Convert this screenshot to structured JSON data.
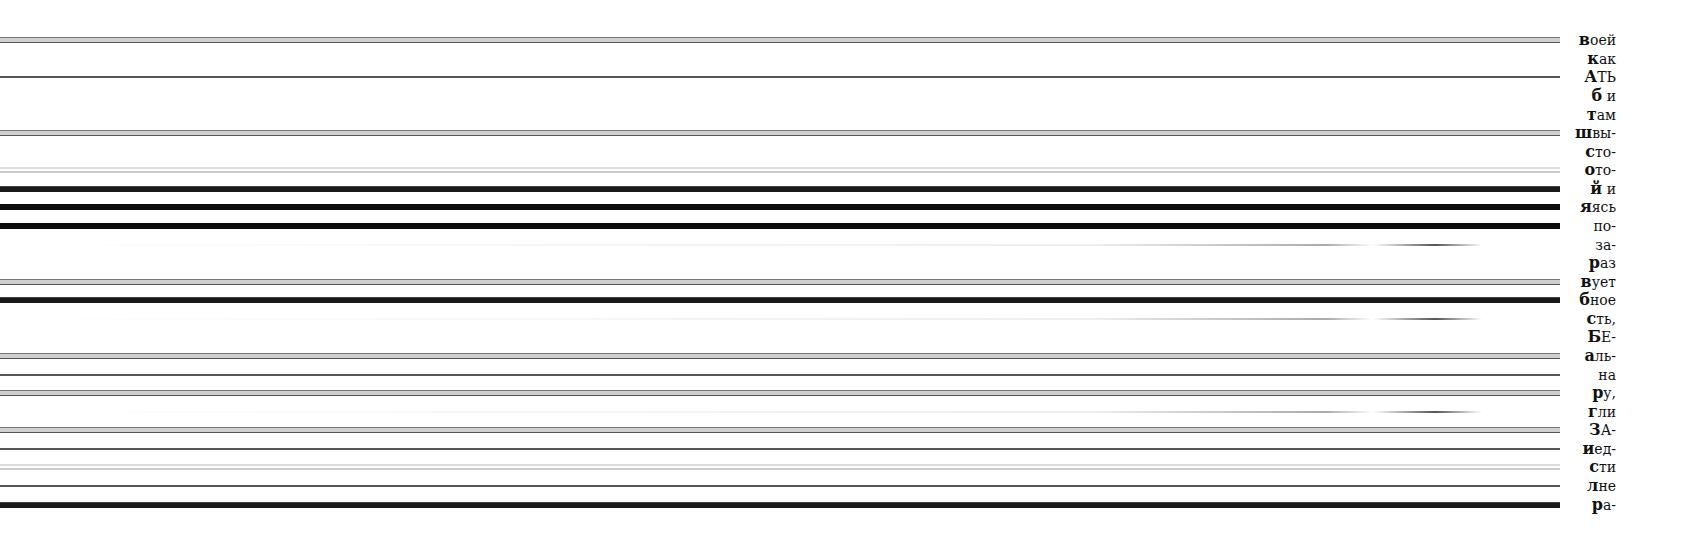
{
  "document": {
    "language": "ru",
    "lines": [
      {
        "y": 39,
        "style": "double",
        "lead": "в",
        "text": "оей"
      },
      {
        "y": 58,
        "style": "none",
        "lead": "к",
        "text": "ак"
      },
      {
        "y": 76,
        "style": "thin",
        "lead": "А",
        "text": "ТЬ"
      },
      {
        "y": 95,
        "style": "none",
        "lead": "б",
        "text": " и"
      },
      {
        "y": 114,
        "style": "none",
        "lead": "т",
        "text": "ам"
      },
      {
        "y": 132,
        "style": "double",
        "lead": "ш",
        "text": "вы-"
      },
      {
        "y": 151,
        "style": "none",
        "lead": "с",
        "text": "то-"
      },
      {
        "y": 169,
        "style": "faint",
        "lead": "о",
        "text": "то-"
      },
      {
        "y": 188,
        "style": "heavy",
        "lead": "й",
        "text": "  и"
      },
      {
        "y": 206,
        "style": "xheavy",
        "lead": "я",
        "text": "ясь"
      },
      {
        "y": 225,
        "style": "xheavy",
        "lead": "",
        "text": "по-"
      },
      {
        "y": 244,
        "style": "dash",
        "lead": "",
        "text": "за-"
      },
      {
        "y": 262,
        "style": "none",
        "lead": "р",
        "text": "аз"
      },
      {
        "y": 281,
        "style": "double",
        "lead": "в",
        "text": "ует"
      },
      {
        "y": 299,
        "style": "heavy",
        "lead": "б",
        "text": "ное"
      },
      {
        "y": 318,
        "style": "dash",
        "lead": "с",
        "text": "ть,"
      },
      {
        "y": 336,
        "style": "none",
        "lead": "Б",
        "text": "Е-"
      },
      {
        "y": 355,
        "style": "double",
        "lead": "а",
        "text": "ль-"
      },
      {
        "y": 374,
        "style": "thin",
        "lead": "",
        "text": "на"
      },
      {
        "y": 392,
        "style": "double",
        "lead": "р",
        "text": "у,"
      },
      {
        "y": 411,
        "style": "dash",
        "lead": "г",
        "text": "ли"
      },
      {
        "y": 429,
        "style": "double",
        "lead": "З",
        "text": "А-"
      },
      {
        "y": 448,
        "style": "thin",
        "lead": "и",
        "text": "ед-"
      },
      {
        "y": 466,
        "style": "faint",
        "lead": "с",
        "text": "ти"
      },
      {
        "y": 485,
        "style": "thin",
        "lead": "л",
        "text": "не"
      },
      {
        "y": 504,
        "style": "heavy",
        "lead": "р",
        "text": "а-"
      }
    ]
  }
}
